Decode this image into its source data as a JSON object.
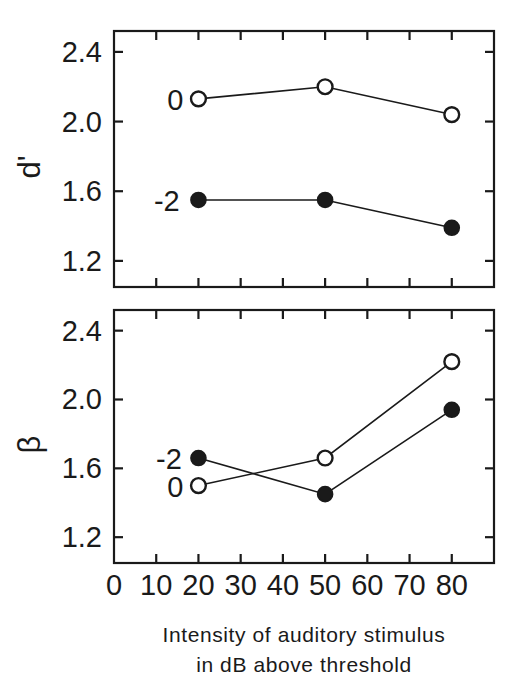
{
  "figure": {
    "name": "two-panel-line-chart",
    "background": "#ffffff",
    "ink_color": "#1a1a1a"
  },
  "xaxis": {
    "label_line1": "Intensity of auditory stimulus",
    "label_line2": "in dB above threshold",
    "ticks": [
      "0",
      "10",
      "20",
      "30",
      "40",
      "50",
      "60",
      "70",
      "80"
    ],
    "tick_values": [
      0,
      10,
      20,
      30,
      40,
      50,
      60,
      70,
      80
    ],
    "min": 0,
    "max": 90
  },
  "panels": [
    {
      "id": "panel-dprime",
      "ylabel": "d'",
      "yticks": [
        "2.4",
        "2.0",
        "1.6",
        "1.2"
      ],
      "ytick_values": [
        2.4,
        2.0,
        1.6,
        1.2
      ],
      "ymin": 1.05,
      "ymax": 2.52,
      "series_labels": [
        {
          "text": "0",
          "x": 14.5,
          "y": 2.13
        },
        {
          "text": "-2",
          "x": 12.5,
          "y": 1.55
        }
      ]
    },
    {
      "id": "panel-beta",
      "ylabel": "β",
      "yticks": [
        "2.4",
        "2.0",
        "1.6",
        "1.2"
      ],
      "ytick_values": [
        2.4,
        2.0,
        1.6,
        1.2
      ],
      "ymin": 1.05,
      "ymax": 2.52,
      "series_labels": [
        {
          "text": "-2",
          "x": 13.0,
          "y": 1.66
        },
        {
          "text": "0",
          "x": 14.5,
          "y": 1.5
        }
      ]
    }
  ],
  "chart_data": [
    {
      "type": "line",
      "panel": "top",
      "title": "",
      "xlabel": "Intensity of auditory stimulus in dB above threshold",
      "ylabel": "d'",
      "x": [
        20,
        50,
        80
      ],
      "xlim": [
        0,
        90
      ],
      "ylim": [
        1.05,
        2.52
      ],
      "xticks": [
        0,
        10,
        20,
        30,
        40,
        50,
        60,
        70,
        80
      ],
      "yticks": [
        1.2,
        1.6,
        2.0,
        2.4
      ],
      "grid": false,
      "legend": "inline-labels",
      "series": [
        {
          "name": "0",
          "marker": "open-circle",
          "values": [
            2.13,
            2.2,
            2.04
          ]
        },
        {
          "name": "-2",
          "marker": "filled-circle",
          "values": [
            1.55,
            1.55,
            1.39
          ]
        }
      ]
    },
    {
      "type": "line",
      "panel": "bottom",
      "title": "",
      "xlabel": "Intensity of auditory stimulus in dB above threshold",
      "ylabel": "β",
      "x": [
        20,
        50,
        80
      ],
      "xlim": [
        0,
        90
      ],
      "ylim": [
        1.05,
        2.52
      ],
      "xticks": [
        0,
        10,
        20,
        30,
        40,
        50,
        60,
        70,
        80
      ],
      "yticks": [
        1.2,
        1.6,
        2.0,
        2.4
      ],
      "grid": false,
      "legend": "inline-labels",
      "series": [
        {
          "name": "-2",
          "marker": "filled-circle",
          "values": [
            1.66,
            1.45,
            1.94
          ]
        },
        {
          "name": "0",
          "marker": "open-circle",
          "values": [
            1.5,
            1.66,
            2.22
          ]
        }
      ]
    }
  ]
}
